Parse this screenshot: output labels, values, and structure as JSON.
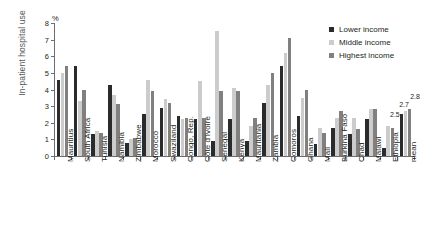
{
  "chart_data": {
    "type": "bar",
    "title": "",
    "xlabel": "",
    "ylabel": "In-patient hospital use",
    "unit_label": "%",
    "ylim": [
      0,
      8
    ],
    "yticks": [
      0,
      1,
      2,
      3,
      4,
      5,
      6,
      7,
      8
    ],
    "grid": false,
    "legend_position": "top-right",
    "categories": [
      "Mauritius",
      "South Africa",
      "Tunisia",
      "Namibia",
      "Zimbabwe",
      "Morocco",
      "Swaziland",
      "Congo, Rep.",
      "Côte d'Ivoire",
      "Senegal",
      "Kenya",
      "Mauritania",
      "Zambia",
      "Comoros",
      "Ghana",
      "Mali",
      "Burkina Faso",
      "Chad",
      "Malawi",
      "Ethiopia",
      "mean"
    ],
    "series": [
      {
        "name": "Lower income",
        "color": "#2b2b2b",
        "values": [
          4.6,
          5.4,
          1.3,
          4.3,
          0.8,
          2.5,
          2.9,
          2.4,
          2.2,
          0.9,
          2.2,
          0.9,
          3.2,
          5.4,
          2.4,
          0.7,
          1.7,
          1.3,
          2.2,
          0.5,
          2.5
        ]
      },
      {
        "name": "Middle income",
        "color": "#cccccc",
        "values": [
          5.0,
          3.3,
          1.5,
          3.7,
          1.0,
          4.6,
          3.4,
          2.2,
          4.5,
          7.5,
          4.1,
          1.8,
          4.3,
          6.2,
          3.5,
          1.7,
          2.3,
          2.3,
          2.8,
          1.8,
          2.7
        ]
      },
      {
        "name": "Highest income",
        "color": "#808080",
        "values": [
          5.4,
          4.0,
          1.4,
          3.1,
          1.1,
          3.9,
          3.2,
          2.3,
          2.3,
          3.9,
          3.9,
          2.3,
          5.0,
          7.1,
          4.0,
          1.4,
          2.7,
          1.6,
          2.8,
          1.7,
          2.8
        ]
      }
    ],
    "data_labels": {
      "category": "mean",
      "values": [
        "2.5",
        "2.7",
        "2.8"
      ]
    }
  },
  "legend": {
    "items": [
      {
        "label": "Lower income"
      },
      {
        "label": "Middle income"
      },
      {
        "label": "Highest income"
      }
    ]
  },
  "caption": {
    "text": ""
  }
}
